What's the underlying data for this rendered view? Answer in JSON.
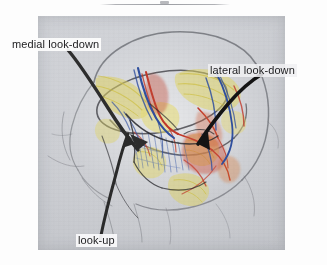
{
  "page": {
    "background_color": "#fdfdfd",
    "rule_color": "#8c8e94"
  },
  "figure": {
    "panel_background_color": "#c9cbd0",
    "medium": "colored pencil and ink sketch"
  },
  "labels": {
    "medial_look_down": "medial look-down",
    "lateral_look_down": "lateral look-down",
    "look_up": "look-up"
  },
  "arrows": {
    "medial": {
      "name": "medial-look-down-arrow",
      "color": "#2e2e2e",
      "direction": "down-right into the medial orbit"
    },
    "lateral": {
      "name": "lateral-look-down-arrow",
      "color": "#141414",
      "direction": "down-left into the lateral orbit"
    },
    "lookup": {
      "name": "look-up-arrow",
      "color": "#2b2b2b",
      "direction": "upward along the inferior orbit"
    }
  },
  "palette": {
    "nerve_yellow": "#d8c84a",
    "artery_red": "#c0392b",
    "vein_blue": "#2f4f9e",
    "pencil_gray": "#6f6f74",
    "muscle_orange": "#d9742e",
    "ink_black": "#1a1a1a"
  }
}
